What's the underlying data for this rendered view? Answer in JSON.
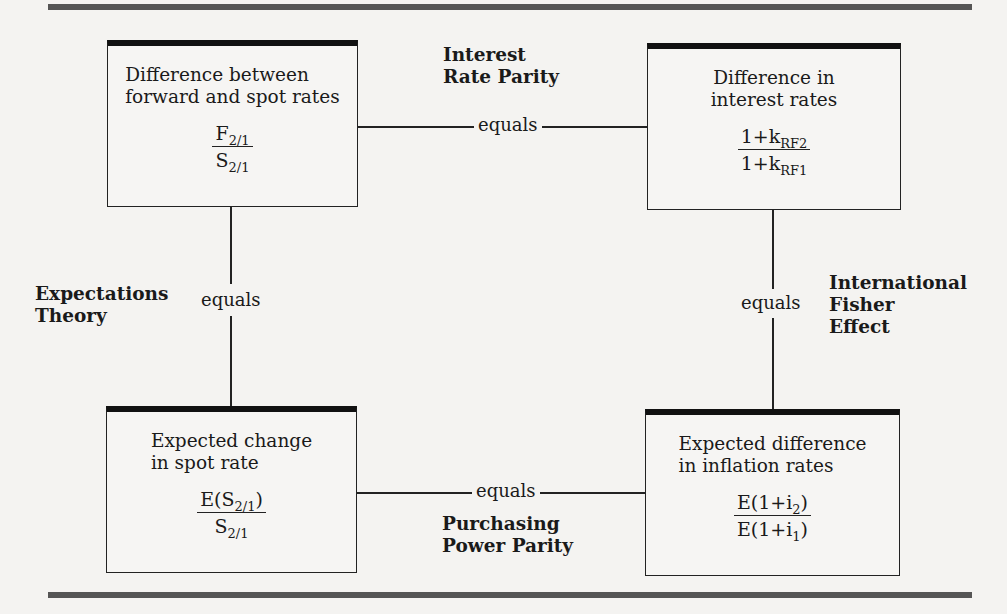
{
  "diagram": {
    "boxes": {
      "top_left": {
        "description": "Difference between forward and spot rates",
        "desc_line1": "Difference between",
        "desc_line2": "forward and spot rates",
        "numerator": {
          "base": "F",
          "sub": "2/1",
          "suffix": ""
        },
        "denominator": {
          "base": "S",
          "sub": "2/1",
          "suffix": ""
        }
      },
      "top_right": {
        "description": "Difference in interest rates",
        "desc_line1": "Difference in",
        "desc_line2": "interest rates",
        "numerator": {
          "base": "1+k",
          "sub": "RF2",
          "suffix": ""
        },
        "denominator": {
          "base": "1+k",
          "sub": "RF1",
          "suffix": ""
        }
      },
      "bottom_left": {
        "description": "Expected change in spot rate",
        "desc_line1": "Expected change",
        "desc_line2": "in spot rate",
        "numerator": {
          "base": "E(S",
          "sub": "2/1",
          "suffix": ")"
        },
        "denominator": {
          "base": "S",
          "sub": "2/1",
          "suffix": ""
        }
      },
      "bottom_right": {
        "description": "Expected difference in inflation rates",
        "desc_line1": "Expected difference",
        "desc_line2": "in inflation rates",
        "numerator": {
          "base": "E(1+i",
          "sub": "2",
          "suffix": ")"
        },
        "denominator": {
          "base": "E(1+i",
          "sub": "1",
          "suffix": ")"
        }
      }
    },
    "connectors": {
      "top": {
        "label": "equals",
        "theory_line1": "Interest",
        "theory_line2": "Rate Parity"
      },
      "left": {
        "label": "equals",
        "theory_line1": "Expectations",
        "theory_line2": "Theory"
      },
      "right": {
        "label": "equals",
        "theory_line1": "International",
        "theory_line2": "Fisher",
        "theory_line3": "Effect"
      },
      "bottom": {
        "label": "equals",
        "theory_line1": "Purchasing",
        "theory_line2": "Power Parity"
      }
    },
    "edges": [
      {
        "from": "top_left",
        "to": "top_right",
        "relation": "Interest Rate Parity"
      },
      {
        "from": "top_left",
        "to": "bottom_left",
        "relation": "Expectations Theory"
      },
      {
        "from": "top_right",
        "to": "bottom_right",
        "relation": "International Fisher Effect"
      },
      {
        "from": "bottom_left",
        "to": "bottom_right",
        "relation": "Purchasing Power Parity"
      }
    ]
  }
}
